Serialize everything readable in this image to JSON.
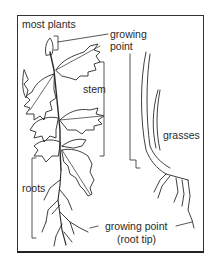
{
  "diagram": {
    "labels": {
      "most_plants": "most plants",
      "growing_point_top_1": "growing",
      "growing_point_top_2": "point",
      "stem": "stem",
      "grasses": "grasses",
      "roots": "roots",
      "growing_point_bottom": "growing point",
      "root_tip": "(root tip)"
    },
    "colors": {
      "line": "#2a2a2a",
      "background": "#ffffff"
    }
  }
}
